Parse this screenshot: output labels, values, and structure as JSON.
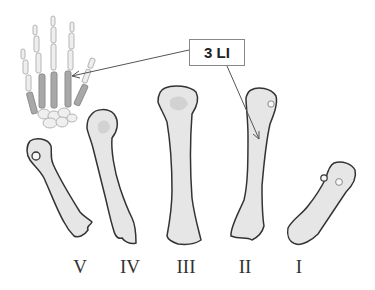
{
  "diagram": {
    "callout_label": "3 LI",
    "inset": "hand-skeleton",
    "bones": [
      {
        "numeral": "V",
        "x": 80
      },
      {
        "numeral": "IV",
        "x": 130
      },
      {
        "numeral": "III",
        "x": 186
      },
      {
        "numeral": "II",
        "x": 245
      },
      {
        "numeral": "I",
        "x": 299
      }
    ]
  },
  "colors": {
    "bone_fill": "#e6e6e6",
    "bone_shade": "#cfcfcf",
    "outline": "#333333",
    "hand_highlight": "#9a9a9a",
    "arrow": "#555555"
  }
}
